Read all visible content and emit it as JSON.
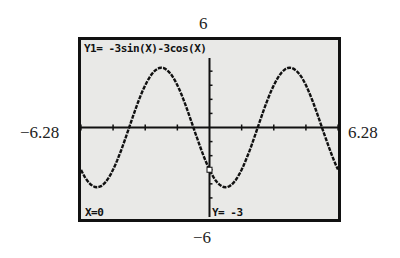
{
  "screen": {
    "equation": "Y1= -3sin(X)-3cos(X)",
    "x_readout": "X=0",
    "y_readout": "Y= -3"
  },
  "window": {
    "xmin_label": "−6.28",
    "xmax_label": "6.28",
    "ymin_label": "−6",
    "ymax_label": "6",
    "xmin": -6.28,
    "xmax": 6.28,
    "ymin": -6,
    "ymax": 6
  },
  "chart_data": {
    "type": "line",
    "title": "Y1= -3sin(X)-3cos(X)",
    "xlabel": "",
    "ylabel": "",
    "xlim": [
      -6.28,
      6.28
    ],
    "ylim": [
      -6,
      6
    ],
    "grid": false,
    "legend": "none",
    "function": "-3*sin(x)-3*cos(x)",
    "series": [
      {
        "name": "Y1",
        "x": [
          -6.28,
          -5.5,
          -4.71,
          -3.93,
          -3.14,
          -2.36,
          -1.57,
          -0.79,
          0,
          0.79,
          1.57,
          2.36,
          3.14,
          3.93,
          4.71,
          5.5,
          6.28
        ],
        "values": [
          -3.0,
          -4.24,
          -3.0,
          0.0,
          3.0,
          4.24,
          3.0,
          0.0,
          -3.0,
          -4.24,
          -3.0,
          0.0,
          3.0,
          4.24,
          3.0,
          0.0,
          -3.0
        ]
      }
    ],
    "annotations": [
      {
        "type": "trace-cursor",
        "x": 0,
        "y": -3,
        "text": "X=0  Y= -3"
      }
    ],
    "x_ticks_interval": 1.5708,
    "y_ticks_interval": 1
  }
}
